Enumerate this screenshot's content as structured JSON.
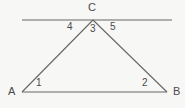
{
  "figure": {
    "type": "geometry-diagram",
    "background_color": "#f7f7f5",
    "line_color": "#666666",
    "text_color": "#4a4a4a",
    "width": 185,
    "height": 108
  },
  "vertices": {
    "a": {
      "label": "A",
      "x": 22,
      "y": 92,
      "label_x": 8,
      "label_y": 87
    },
    "b": {
      "label": "B",
      "x": 167,
      "y": 92,
      "label_x": 172,
      "label_y": 87
    },
    "c": {
      "label": "C",
      "x": 93,
      "y": 20,
      "label_x": 88,
      "label_y": 2
    }
  },
  "parallel_line": {
    "name": "line-through-c",
    "x1": 22,
    "y1": 20,
    "x2": 172,
    "y2": 20
  },
  "segments": [
    {
      "name": "side-ac",
      "x1": 22,
      "y1": 92,
      "x2": 93,
      "y2": 20
    },
    {
      "name": "side-cb",
      "x1": 93,
      "y1": 20,
      "x2": 167,
      "y2": 92
    },
    {
      "name": "side-ab",
      "x1": 22,
      "y1": 92,
      "x2": 167,
      "y2": 92
    }
  ],
  "angles": [
    {
      "name": "angle-1",
      "label": "1",
      "at_vertex": "A",
      "x": 36,
      "y": 79
    },
    {
      "name": "angle-2",
      "label": "2",
      "at_vertex": "B",
      "x": 142,
      "y": 79
    },
    {
      "name": "angle-3",
      "label": "3",
      "at_vertex": "C",
      "x": 89,
      "y": 24
    },
    {
      "name": "angle-4",
      "label": "4",
      "at_vertex": "C",
      "x": 67,
      "y": 22
    },
    {
      "name": "angle-5",
      "label": "5",
      "at_vertex": "C",
      "x": 110,
      "y": 22
    }
  ]
}
